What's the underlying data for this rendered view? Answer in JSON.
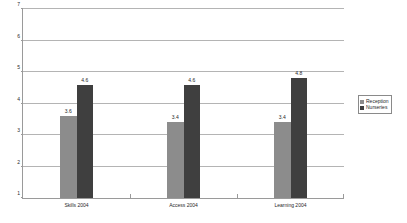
{
  "chart_data": {
    "type": "bar",
    "title": "",
    "xlabel": "",
    "ylabel": "",
    "ylim": [
      1,
      7
    ],
    "yticks": [
      1,
      2,
      3,
      4,
      5,
      6,
      7
    ],
    "grid": true,
    "legend_position": "right",
    "categories": [
      "Skills 2004",
      "Access 2004",
      "Learning 2004"
    ],
    "series": [
      {
        "name": "Reception",
        "color": "#8c8c8c",
        "values": [
          3.6,
          3.4,
          3.4
        ],
        "labels": [
          "3.6",
          "3.4",
          "3.4"
        ]
      },
      {
        "name": "Nurseries",
        "color": "#3f3f3f",
        "values": [
          4.6,
          4.6,
          4.8
        ],
        "labels": [
          "4.6",
          "4.6",
          "4.8"
        ]
      }
    ]
  },
  "axis": {
    "tick_labels": [
      "7",
      "6",
      "5",
      "4",
      "3",
      "2",
      "1"
    ]
  },
  "legend": {
    "items": [
      {
        "label": "Reception",
        "color": "#8c8c8c"
      },
      {
        "label": "Nurseries",
        "color": "#3f3f3f"
      }
    ]
  },
  "colors": {
    "reception": "#8c8c8c",
    "nurseries": "#3f3f3f",
    "gridline": "#b4b4b4",
    "axis": "#9a9a9a",
    "background": "#ffffff"
  }
}
